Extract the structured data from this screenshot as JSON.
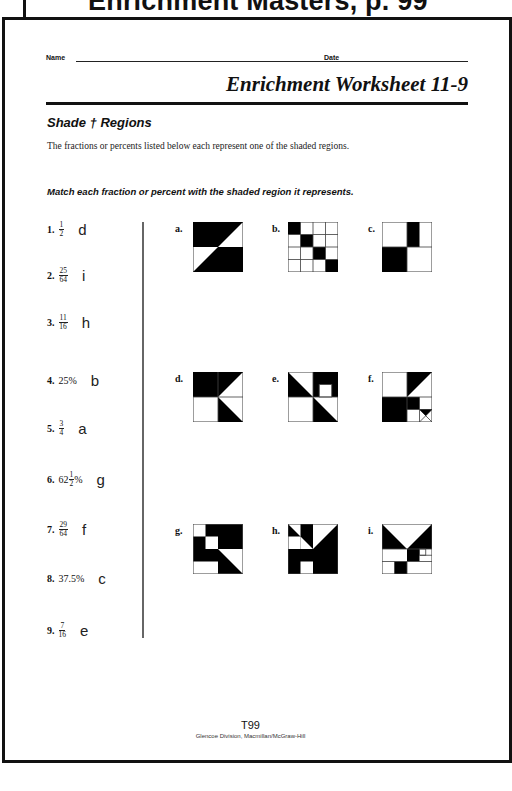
{
  "header": {
    "title": "Enrichment Masters, p. 99"
  },
  "form": {
    "name_label": "Name",
    "date_label": "Date"
  },
  "worksheet": {
    "title": "Enrichment Worksheet 11-9",
    "section_title": "Shade † Regions",
    "intro": "The fractions or percents listed below each represent one of the shaded regions.",
    "instructions": "Match each fraction or percent with the shaded region it represents."
  },
  "problems": [
    {
      "number": "1.",
      "numerator": "1",
      "denominator": "2",
      "whole": "",
      "suffix": "",
      "answer": "d"
    },
    {
      "number": "2.",
      "numerator": "25",
      "denominator": "64",
      "whole": "",
      "suffix": "",
      "answer": "i"
    },
    {
      "number": "3.",
      "numerator": "11",
      "denominator": "16",
      "whole": "",
      "suffix": "",
      "answer": "h"
    },
    {
      "number": "4.",
      "value": "25%",
      "answer": "b"
    },
    {
      "number": "5.",
      "numerator": "3",
      "denominator": "4",
      "whole": "",
      "suffix": "",
      "answer": "a"
    },
    {
      "number": "6.",
      "numerator": "1",
      "denominator": "2",
      "whole": "62",
      "suffix": "%",
      "answer": "g"
    },
    {
      "number": "7.",
      "numerator": "29",
      "denominator": "64",
      "whole": "",
      "suffix": "",
      "answer": "f"
    },
    {
      "number": "8.",
      "value": "37.5%",
      "answer": "c"
    },
    {
      "number": "9.",
      "numerator": "7",
      "denominator": "16",
      "whole": "",
      "suffix": "",
      "answer": "e"
    }
  ],
  "regions": [
    {
      "label": "a."
    },
    {
      "label": "b."
    },
    {
      "label": "c."
    },
    {
      "label": "d."
    },
    {
      "label": "e."
    },
    {
      "label": "f."
    },
    {
      "label": "g."
    },
    {
      "label": "h."
    },
    {
      "label": "i."
    }
  ],
  "footer": {
    "page": "T99",
    "publisher": "Glencoe Division, Macmillan/McGraw-Hill"
  }
}
